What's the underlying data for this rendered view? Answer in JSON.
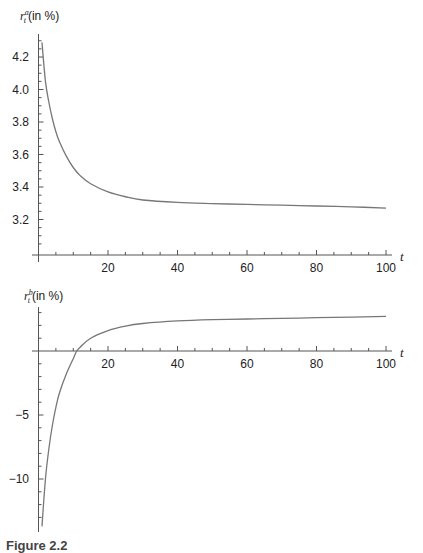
{
  "chart_data": [
    {
      "type": "line",
      "title": "",
      "ylabel": "r_t^a (in %)",
      "xlabel": "t",
      "xlim": [
        0,
        100
      ],
      "ylim": [
        3.05,
        4.32
      ],
      "x_ticks": [
        20,
        40,
        60,
        80,
        100
      ],
      "y_ticks": [
        3.2,
        3.4,
        3.6,
        3.8,
        4.0,
        4.2
      ],
      "grid": false,
      "legend": null,
      "series": [
        {
          "name": "r_t^a",
          "x": [
            1,
            2,
            3,
            4,
            5,
            6,
            8,
            10,
            12,
            15,
            20,
            25,
            30,
            40,
            50,
            60,
            70,
            80,
            90,
            100
          ],
          "values": [
            4.29,
            4.05,
            3.92,
            3.82,
            3.74,
            3.68,
            3.59,
            3.52,
            3.47,
            3.42,
            3.37,
            3.34,
            3.32,
            3.305,
            3.298,
            3.293,
            3.288,
            3.283,
            3.278,
            3.27
          ]
        }
      ]
    },
    {
      "type": "line",
      "title": "",
      "ylabel": "r_t^b (in %)",
      "xlabel": "t",
      "xlim": [
        0,
        100
      ],
      "ylim": [
        -14,
        3.5
      ],
      "x_ticks": [
        20,
        40,
        60,
        80,
        100
      ],
      "y_ticks": [
        -10,
        -5
      ],
      "grid": false,
      "legend": null,
      "series": [
        {
          "name": "r_t^b",
          "x": [
            1,
            2,
            3,
            4,
            5,
            6,
            8,
            10,
            11,
            12,
            15,
            20,
            25,
            30,
            40,
            50,
            60,
            70,
            80,
            90,
            100
          ],
          "values": [
            -13.7,
            -10.0,
            -7.6,
            -5.8,
            -4.4,
            -3.3,
            -1.8,
            -0.6,
            0.0,
            0.3,
            1.0,
            1.6,
            1.95,
            2.15,
            2.35,
            2.45,
            2.5,
            2.55,
            2.6,
            2.65,
            2.7
          ]
        }
      ]
    }
  ],
  "top": {
    "ylabel_main": "r",
    "ylabel_sup": "a",
    "ylabel_sub": "t",
    "ylabel_unit": "(in %)",
    "xlabel": "t",
    "y_tick_labels": [
      "4.2",
      "4.0",
      "3.8",
      "3.6",
      "3.4",
      "3.2"
    ],
    "x_tick_labels": [
      "20",
      "40",
      "60",
      "80",
      "100"
    ]
  },
  "bottom": {
    "ylabel_main": "r",
    "ylabel_sup": "b",
    "ylabel_sub": "t",
    "ylabel_unit": "(in %)",
    "xlabel": "t",
    "y_tick_labels": [
      "-5",
      "-10"
    ],
    "x_tick_labels": [
      "20",
      "40",
      "60",
      "80",
      "100"
    ]
  },
  "caption": "Figure 2.2"
}
